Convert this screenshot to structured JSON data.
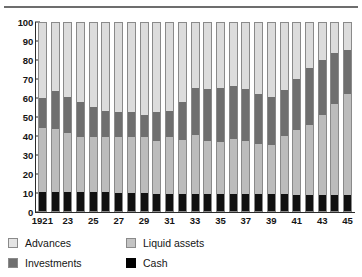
{
  "chart_data": {
    "type": "bar",
    "subtype": "stacked-100-percent",
    "title": "",
    "xlabel": "",
    "ylabel": "",
    "ylim": [
      0,
      100
    ],
    "yticks": [
      0,
      10,
      20,
      30,
      40,
      50,
      60,
      70,
      80,
      90,
      100
    ],
    "grid": false,
    "legend_position": "bottom-left",
    "stack_order_bottom_to_top": [
      "Cash",
      "Liquid assets",
      "Investments",
      "Advances"
    ],
    "categories": [
      "1921",
      "1922",
      "1923",
      "1924",
      "1925",
      "1926",
      "1927",
      "1928",
      "1929",
      "1930",
      "1931",
      "1932",
      "1933",
      "1934",
      "1935",
      "1936",
      "1937",
      "1938",
      "1939",
      "1940",
      "1941",
      "1942",
      "1943",
      "1944",
      "1945"
    ],
    "tick_labels": [
      "1921",
      "23",
      "25",
      "27",
      "29",
      "31",
      "33",
      "35",
      "37",
      "39",
      "41",
      "43",
      "45"
    ],
    "series": [
      {
        "name": "Cash",
        "color": "#111111",
        "values": [
          10,
          10,
          10,
          10,
          10,
          10,
          9.5,
          9.5,
          9.5,
          9,
          9,
          9,
          9,
          9,
          9,
          9,
          9,
          9,
          9,
          9,
          8.5,
          8.5,
          8.5,
          8.5,
          8.5
        ]
      },
      {
        "name": "Liquid assets",
        "color": "#bcbcbc",
        "values": [
          33.5,
          33,
          31,
          29,
          29,
          29,
          29.5,
          29.5,
          29.5,
          28,
          30,
          28.5,
          31,
          28,
          27.5,
          29,
          28,
          26.5,
          26,
          30.5,
          34,
          37,
          42,
          48,
          53
        ]
      },
      {
        "name": "Investments",
        "color": "#6f6f6f",
        "values": [
          16,
          20,
          19,
          18.5,
          15.5,
          13.5,
          13,
          13,
          11.5,
          15,
          13.5,
          20,
          24.5,
          27,
          28,
          28,
          27,
          26,
          25,
          24,
          27,
          30,
          29,
          26.5,
          23
        ]
      },
      {
        "name": "Advances",
        "color": "#dcdcdc",
        "values": [
          40.5,
          37,
          40,
          42.5,
          45.5,
          47.5,
          48,
          48,
          49.5,
          48,
          47.5,
          42.5,
          35.5,
          36,
          35.5,
          34,
          36,
          38.5,
          40,
          36.5,
          30.5,
          24.5,
          20.5,
          17,
          15.5
        ]
      }
    ],
    "cumulative_tops": {
      "cash": [
        10,
        10,
        10,
        10,
        10,
        10,
        9.5,
        9.5,
        9.5,
        9,
        9,
        9,
        9,
        9,
        9,
        9,
        9,
        9,
        9,
        9,
        8.5,
        8.5,
        8.5,
        8.5,
        8.5
      ],
      "liquid": [
        43.5,
        43,
        41,
        39,
        39,
        39,
        39,
        39,
        39,
        37,
        39,
        37.5,
        40,
        37,
        36.5,
        38,
        37,
        35.5,
        35,
        39.5,
        42.5,
        45.5,
        50.5,
        56.5,
        61.5
      ],
      "investments": [
        59.5,
        63,
        60,
        57.5,
        54.5,
        52.5,
        52,
        52,
        50.5,
        52,
        52.5,
        57.5,
        64.5,
        64,
        64.5,
        66,
        64,
        61.5,
        60,
        63.5,
        69.5,
        75.5,
        79.5,
        83,
        84.5
      ],
      "advances": [
        100,
        100,
        100,
        100,
        100,
        100,
        100,
        100,
        100,
        100,
        100,
        100,
        100,
        100,
        100,
        100,
        100,
        100,
        100,
        100,
        100,
        100,
        100,
        100,
        100
      ]
    }
  },
  "legend": {
    "items": [
      {
        "label": "Advances",
        "swatch": "advances"
      },
      {
        "label": "Liquid assets",
        "swatch": "liquid"
      },
      {
        "label": "Investments",
        "swatch": "invest"
      },
      {
        "label": "Cash",
        "swatch": "cash"
      }
    ]
  },
  "colors": {
    "advances": "#dcdcdc",
    "liquid_assets": "#bcbcbc",
    "investments": "#6f6f6f",
    "cash": "#111111",
    "axis": "#2b2b2b",
    "rule": "#6d6d6d"
  }
}
